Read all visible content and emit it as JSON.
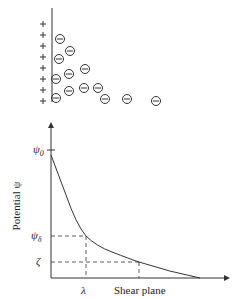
{
  "top_panel": {
    "plus_signs": 8,
    "negative_ions": [
      [
        60,
        39
      ],
      [
        70,
        51
      ],
      [
        59,
        59
      ],
      [
        85,
        69
      ],
      [
        69,
        74
      ],
      [
        56,
        79
      ],
      [
        69,
        91
      ],
      [
        84,
        88
      ],
      [
        98,
        88
      ],
      [
        56,
        98
      ],
      [
        105,
        99
      ],
      [
        127,
        99
      ],
      [
        156,
        101
      ]
    ]
  },
  "chart": {
    "y_axis_label": "Potential ψ",
    "x_axis_label": "Shear plane",
    "psi0_label": "ψ",
    "psi0_sub": "0",
    "psid_label": "ψ",
    "psid_sub": "δ",
    "zeta_label": "ζ",
    "lambda_label": "λ"
  },
  "chart_data": {
    "type": "line",
    "title": "",
    "xlabel": "Shear plane",
    "ylabel": "Potential ψ",
    "annotations": [
      "ψ0",
      "ψδ",
      "ζ",
      "λ"
    ],
    "x": [
      0,
      1,
      2,
      3,
      4,
      5,
      6,
      7
    ],
    "values": [
      1.0,
      0.62,
      0.32,
      0.28,
      0.2,
      0.12,
      0.05,
      0.0
    ]
  }
}
